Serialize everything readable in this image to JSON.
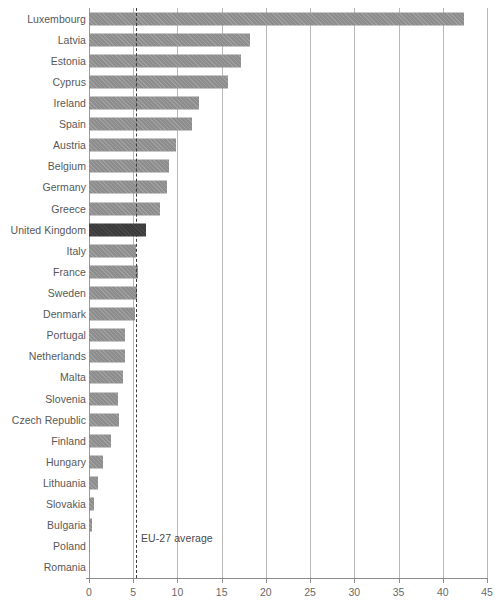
{
  "chart_data": {
    "type": "bar",
    "orientation": "horizontal",
    "title": "",
    "subtitle": "",
    "xlabel": "",
    "ylabel": "",
    "xlim": [
      0,
      45
    ],
    "grid": true,
    "legend": "none",
    "xticks": [
      0,
      5,
      10,
      15,
      20,
      25,
      30,
      35,
      40,
      45
    ],
    "xtick_labels": [
      "0",
      "5",
      "10",
      "15",
      "20",
      "25",
      "30",
      "35",
      "40",
      "45"
    ],
    "categories": [
      "Luxembourg",
      "Latvia",
      "Estonia",
      "Cyprus",
      "Ireland",
      "Spain",
      "Austria",
      "Belgium",
      "Germany",
      "Greece",
      "United Kingdom",
      "Italy",
      "France",
      "Sweden",
      "Denmark",
      "Portugal",
      "Netherlands",
      "Malta",
      "Slovenia",
      "Czech Republic",
      "Finland",
      "Hungary",
      "Lithuania",
      "Slovakia",
      "Bulgaria",
      "Poland",
      "Romania"
    ],
    "values": [
      42.4,
      18.2,
      17.2,
      15.7,
      12.4,
      11.6,
      9.8,
      9.1,
      8.8,
      8.0,
      6.5,
      5.3,
      5.5,
      5.4,
      5.2,
      4.1,
      4.1,
      3.8,
      3.3,
      3.4,
      2.5,
      1.6,
      1.0,
      0.6,
      0.3,
      0.1,
      0.05
    ],
    "highlighted_category": "United Kingdom",
    "annotations": [
      {
        "name": "eu-27-average",
        "label": "EU-27 average",
        "value": 5.3,
        "style": "dashed-vertical-line"
      }
    ],
    "colors": {
      "bar": "#8d8d8d",
      "bar_highlight": "#3b3b3b",
      "gridline": "#b9b9b9",
      "axis": "#8c8c8c",
      "label_text": "#585858",
      "tick_text": "#6a6a6a",
      "annotation_text": "#4a4a4a",
      "background": "#ffffff"
    }
  }
}
